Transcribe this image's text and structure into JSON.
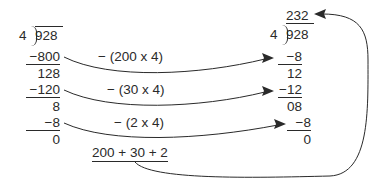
{
  "left": {
    "divisor": "4",
    "dividend": "928",
    "steps": [
      {
        "subtract": "−800",
        "remainder": "128"
      },
      {
        "subtract": "−120",
        "remainder": "8"
      },
      {
        "subtract": "−8",
        "remainder": "0"
      }
    ]
  },
  "middle": {
    "operations": [
      "− (200 x 4)",
      "− (30 x 4)",
      "− (2 x 4)"
    ],
    "sum": "200 + 30 + 2"
  },
  "right": {
    "quotient": "232",
    "divisor": "4",
    "dividend": "928",
    "steps": [
      {
        "subtract": "−8",
        "remainder": "12"
      },
      {
        "subtract": "−12",
        "remainder": "08"
      },
      {
        "subtract": "−8",
        "remainder": "0"
      }
    ]
  }
}
